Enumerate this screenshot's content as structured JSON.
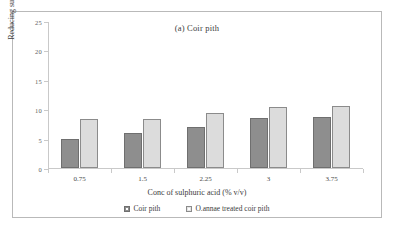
{
  "chart_data": {
    "type": "bar",
    "title": "(a) Coir pith",
    "xlabel": "Conc of sulphuric acid (% v/v)",
    "ylabel": "Reducing sugars (g/L)",
    "categories": [
      "0.75",
      "1.5",
      "2.25",
      "3",
      "3.75"
    ],
    "series": [
      {
        "name": "Coir pith",
        "values": [
          5.0,
          6.0,
          7.0,
          8.5,
          8.7
        ],
        "color": "#8e8e8e"
      },
      {
        "name": "O.annae treated coir pith",
        "values": [
          8.3,
          8.4,
          9.3,
          10.4,
          10.6
        ],
        "color": "#dcdcdc"
      }
    ],
    "ylim": [
      0,
      25
    ],
    "yticks": [
      "0",
      "5",
      "10",
      "15",
      "20",
      "25"
    ],
    "grid": false,
    "legend_position": "bottom"
  },
  "figure": {
    "frame_color": "#b9b9b9",
    "background": "#ffffff"
  }
}
